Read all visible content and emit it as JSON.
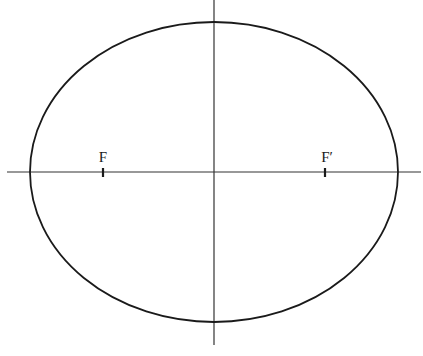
{
  "diagram": {
    "type": "ellipse-with-foci",
    "canvas": {
      "width": 423,
      "height": 356,
      "background": "#ffffff"
    },
    "colors": {
      "stroke": "#1a1a1a",
      "axis": "#333333"
    },
    "ellipse": {
      "cx": 214,
      "cy": 172,
      "rx": 184,
      "ry": 150
    },
    "axes": {
      "horizontal": {
        "x1": 7,
        "x2": 421,
        "y": 172
      },
      "vertical": {
        "x": 214,
        "y1": 0,
        "y2": 345
      }
    },
    "foci": [
      {
        "label": "F",
        "x": 103,
        "y": 172
      },
      {
        "label": "F′",
        "x": 325,
        "y": 172
      }
    ]
  }
}
